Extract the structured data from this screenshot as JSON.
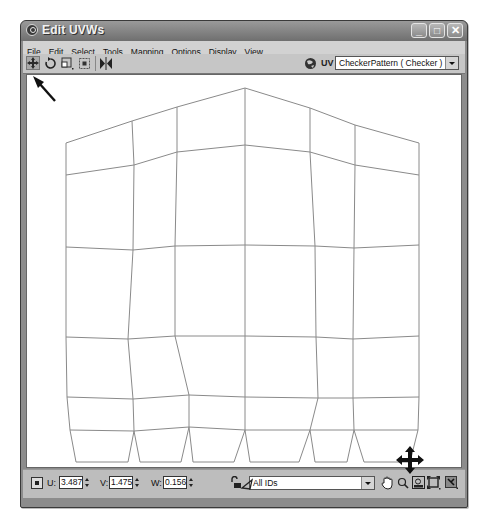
{
  "window": {
    "title": "Edit UVWs",
    "controls": {
      "minimize": "_",
      "maximize": "□",
      "close": "✕"
    }
  },
  "menubar": {
    "items": [
      {
        "label": "File"
      },
      {
        "label": "Edit"
      },
      {
        "label": "Select"
      },
      {
        "label": "Tools"
      },
      {
        "label": "Mapping"
      },
      {
        "label": "Options"
      },
      {
        "label": "Display"
      },
      {
        "label": "View"
      }
    ]
  },
  "toolbar": {
    "tools": [
      {
        "name": "move-tool",
        "icon": "move-arrows-icon",
        "active": true
      },
      {
        "name": "rotate-tool",
        "icon": "rotate-icon"
      },
      {
        "name": "scale-tool",
        "icon": "scale-icon"
      },
      {
        "name": "freeform-tool",
        "icon": "freeform-icon"
      },
      {
        "name": "mirror-tool",
        "icon": "mirror-icon"
      }
    ],
    "uv_label": "UV",
    "map_select": "CheckerPattern  ( Checker )"
  },
  "viewport": {
    "mesh_color": "#8a8a8a",
    "mesh_rows": [
      [
        [
          66,
          143
        ],
        [
          132,
          121
        ],
        [
          177,
          107
        ],
        [
          245,
          88
        ],
        [
          310,
          108
        ],
        [
          355,
          125
        ],
        [
          419,
          143
        ]
      ],
      [
        [
          66,
          175
        ],
        [
          134,
          165
        ],
        [
          177,
          152
        ],
        [
          245,
          145
        ],
        [
          310,
          152
        ],
        [
          355,
          165
        ],
        [
          419,
          175
        ]
      ],
      [
        [
          66,
          247
        ],
        [
          133,
          250
        ],
        [
          175,
          246
        ],
        [
          245,
          245
        ],
        [
          315,
          246
        ],
        [
          354,
          248
        ],
        [
          419,
          245
        ]
      ],
      [
        [
          66,
          337
        ],
        [
          128,
          339
        ],
        [
          175,
          336
        ],
        [
          245,
          336
        ],
        [
          316,
          337
        ],
        [
          353,
          339
        ],
        [
          419,
          336
        ]
      ],
      [
        [
          67,
          397
        ],
        [
          133,
          399
        ],
        [
          189,
          395
        ],
        [
          245,
          397
        ],
        [
          318,
          398
        ],
        [
          353,
          398
        ],
        [
          419,
          397
        ]
      ],
      [
        [
          70,
          430
        ],
        [
          134,
          431
        ],
        [
          189,
          427
        ],
        [
          245,
          430
        ],
        [
          310,
          430
        ],
        [
          354,
          430
        ],
        [
          418,
          430
        ]
      ]
    ],
    "bottom_outline": [
      [
        70,
        430
      ],
      [
        76,
        462
      ],
      [
        128,
        462
      ],
      [
        134,
        431
      ],
      [
        140,
        462
      ],
      [
        181,
        462
      ],
      [
        189,
        427
      ],
      [
        193,
        462
      ],
      [
        234,
        462
      ],
      [
        245,
        430
      ],
      [
        250,
        462
      ],
      [
        299,
        462
      ],
      [
        310,
        430
      ],
      [
        315,
        462
      ],
      [
        347,
        462
      ],
      [
        354,
        430
      ],
      [
        364,
        462
      ],
      [
        410,
        462
      ],
      [
        418,
        430
      ]
    ]
  },
  "bottombar": {
    "absolute_toggle_icon": "absolute-offset-icon",
    "u_label": "U:",
    "u_value": "3.487",
    "v_label": "V:",
    "v_value": "1.475",
    "w_label": "W:",
    "w_value": "0.156",
    "lock_icon": "lock-icon",
    "filter_icon": "filter-selected-faces-icon",
    "ids_select": "All IDs",
    "nav_icons": [
      "pan-hand-icon",
      "zoom-icon",
      "zoom-region-icon",
      "zoom-extents-icon",
      "zoom-extents-selected-icon"
    ]
  },
  "annotations": {
    "arrow_pointer": "pointing to move tool",
    "move_cursor": "move cursor at bottom-right vertex"
  }
}
